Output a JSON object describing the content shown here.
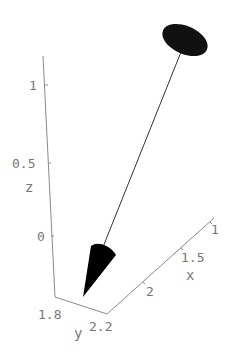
{
  "figure": {
    "type": "3d-vector-plot"
  },
  "axes": {
    "z": {
      "label": "z",
      "ticks": [
        "0",
        "0.5",
        "1"
      ]
    },
    "y": {
      "label": "y",
      "ticks": [
        "1.8",
        "2.2"
      ]
    },
    "x": {
      "label": "x",
      "ticks": [
        "2",
        "1.5",
        "1"
      ]
    }
  },
  "shapes": {
    "tail_disk": {
      "shape": "ellipse",
      "color": "#111111"
    },
    "shaft": {
      "shape": "line",
      "color": "#333333"
    },
    "head_cone": {
      "shape": "cone",
      "color": "#000000"
    }
  },
  "colors": {
    "axis": "#8a8a8a",
    "text": "#777777",
    "background": "#ffffff"
  }
}
